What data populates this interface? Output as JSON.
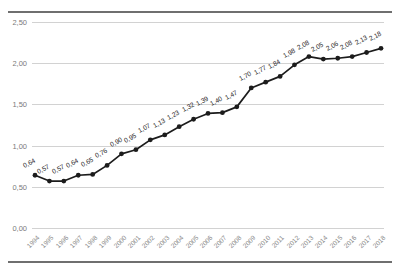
{
  "corner_note": "",
  "chart_data": {
    "type": "line",
    "title": "",
    "subtitle": "",
    "xlabel": "",
    "ylabel": "",
    "legend": [],
    "grid": true,
    "legend_position": "none",
    "ylim": [
      0.0,
      2.5
    ],
    "yticks": [
      0.0,
      0.5,
      1.0,
      1.5,
      2.0,
      2.5
    ],
    "ytick_labels": [
      "0,00",
      "0,50",
      "1,00",
      "1,50",
      "2,00",
      "2,50"
    ],
    "decimal_separator": ",",
    "categories": [
      "1994",
      "1995",
      "1996",
      "1997",
      "1998",
      "1999",
      "2000",
      "2001",
      "2002",
      "2003",
      "2004",
      "2005",
      "2006",
      "2007",
      "2008",
      "2009",
      "2010",
      "2011",
      "2012",
      "2013",
      "2014",
      "2015",
      "2016",
      "2017",
      "2018"
    ],
    "values": [
      0.64,
      0.57,
      0.57,
      0.64,
      0.65,
      0.76,
      0.9,
      0.95,
      1.07,
      1.13,
      1.23,
      1.32,
      1.39,
      1.4,
      1.47,
      1.7,
      1.77,
      1.84,
      1.98,
      2.08,
      2.05,
      2.06,
      2.08,
      2.13,
      2.18
    ],
    "value_labels": [
      "0,64",
      "0,57",
      "0,57",
      "0,64",
      "0,65",
      "0,76",
      "0,90",
      "0,95",
      "1,07",
      "1,13",
      "1,23",
      "1,32",
      "1,39",
      "1,40",
      "1,47",
      "1,70",
      "1,77",
      "1,84",
      "1,98",
      "2,08",
      "2,05",
      "2,06",
      "2,08",
      "2,13",
      "2,18"
    ],
    "series_color": "#1c1c1c",
    "grid_color": "#d2d2d2"
  }
}
